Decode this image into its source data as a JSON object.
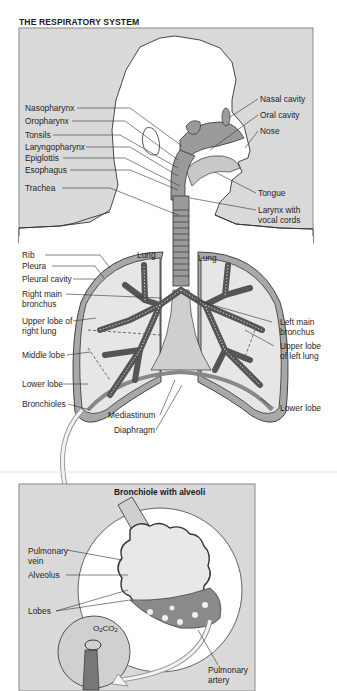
{
  "title": "THE RESPIRATORY SYSTEM",
  "colors": {
    "panel_bg": "#d9d9d9",
    "panel_border": "#8a8a8a",
    "airway_fill": "#9a9a9a",
    "lung_fill": "#e6e6e6",
    "pleura_fill": "#a8a8a8",
    "line": "#333333"
  },
  "head_labels_left": [
    {
      "text": "Nasopharynx"
    },
    {
      "text": "Oropharynx"
    },
    {
      "text": "Tonsils"
    },
    {
      "text": "Laryngopharynx"
    },
    {
      "text": "Epiglottis"
    },
    {
      "text": "Esophagus"
    },
    {
      "text": "Trachea"
    }
  ],
  "head_labels_right": [
    {
      "text": "Nasal cavity"
    },
    {
      "text": "Oral cavity"
    },
    {
      "text": "Nose"
    },
    {
      "text": "Tongue"
    },
    {
      "text": "Larynx with",
      "text2": "vocal cords"
    }
  ],
  "lung_labels_left": [
    {
      "text": "Rib"
    },
    {
      "text": "Pleura"
    },
    {
      "text": "Pleural cavity"
    },
    {
      "text": "Right main",
      "text2": "bronchus"
    },
    {
      "text": "Upper lobe of",
      "text2": "right lung"
    },
    {
      "text": "Middle lobe"
    },
    {
      "text": "Lower lobe"
    },
    {
      "text": "Bronchioles"
    }
  ],
  "lung_labels_right": [
    {
      "text": "Left main",
      "text2": "bronchus"
    },
    {
      "text": "Upper lobe",
      "text2": "of left lung"
    },
    {
      "text": "Lower lobe"
    }
  ],
  "lung_inner_labels": [
    {
      "text": "Lung"
    },
    {
      "text": "Lung"
    }
  ],
  "center_labels": [
    {
      "text": "Mediastinum"
    },
    {
      "text": "Diaphragm"
    }
  ],
  "inset": {
    "title": "Bronchiole with alveoli",
    "labels_left": [
      {
        "text": "Pulmonary",
        "text2": "vein"
      },
      {
        "text": "Alveolus"
      },
      {
        "text": "Lobes"
      }
    ],
    "labels_right": [
      {
        "text": "Pulmonary",
        "text2": "artery"
      }
    ],
    "gas_exchange": {
      "o2": "O",
      "o2_sub": "2",
      "co2": "CO",
      "co2_sub": "2"
    }
  }
}
